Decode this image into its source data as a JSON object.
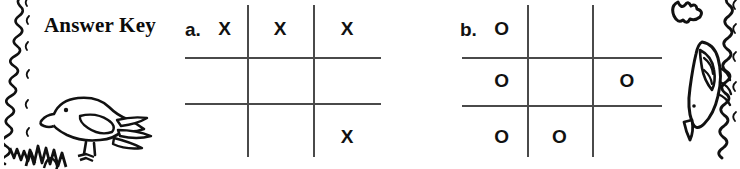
{
  "page": {
    "title": "Answer Key",
    "background_color": "#ffffff",
    "ink_color": "#111111",
    "rule_color": "#4a4a4a"
  },
  "decorations": [
    {
      "name": "left-squiggle-border",
      "description": "hand-drawn wavy vertical border"
    },
    {
      "name": "right-squiggle-border",
      "description": "hand-drawn wavy vertical border"
    },
    {
      "name": "bird-illustration-left",
      "description": "line-art bird standing on grass"
    },
    {
      "name": "bird-illustration-right",
      "description": "line-art bird in flight"
    },
    {
      "name": "bird-illustration-corner",
      "description": "small line-art bird at top right"
    }
  ],
  "puzzles": [
    {
      "id": "a",
      "label": "a.",
      "rows": [
        [
          "X",
          "X",
          "X"
        ],
        [
          "",
          "",
          ""
        ],
        [
          "",
          "",
          "X"
        ]
      ]
    },
    {
      "id": "b",
      "label": "b.",
      "rows": [
        [
          "O",
          "",
          ""
        ],
        [
          "O",
          "",
          "O"
        ],
        [
          "O",
          "O",
          ""
        ]
      ]
    }
  ]
}
